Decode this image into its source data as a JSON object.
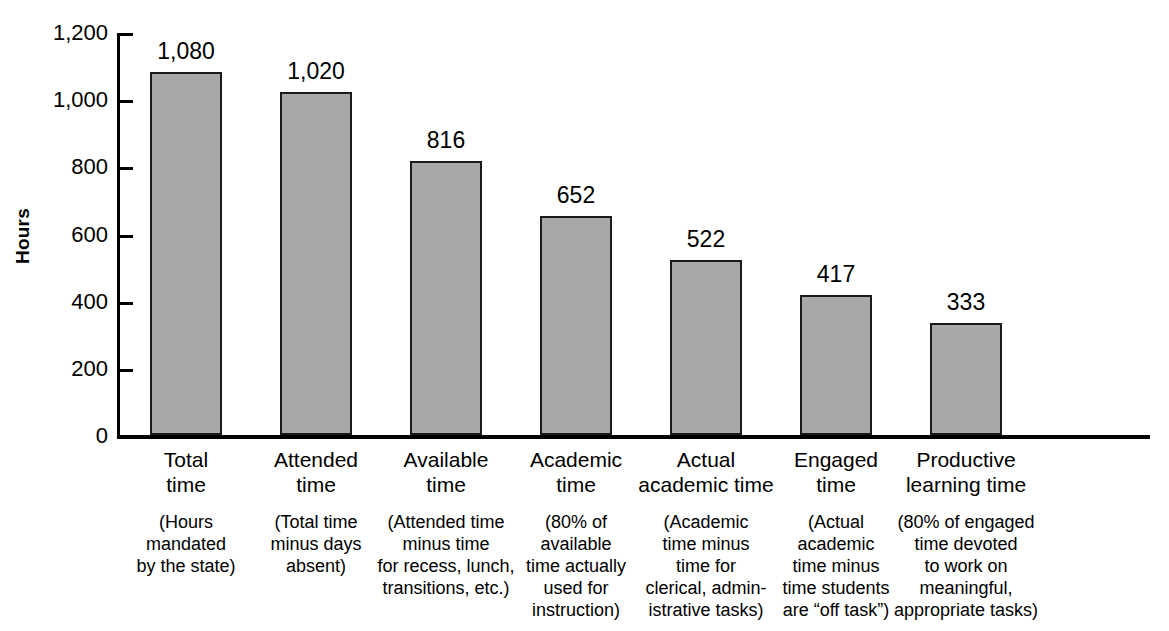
{
  "chart_data": {
    "type": "bar",
    "title": "",
    "xlabel": "",
    "ylabel": "Hours",
    "ylim": [
      0,
      1200
    ],
    "grid": false,
    "legend": null,
    "categories": [
      "Total\ntime",
      "Attended\ntime",
      "Available\ntime",
      "Academic\ntime",
      "Actual\nacademic time",
      "Engaged\ntime",
      "Productive\nlearning time"
    ],
    "category_notes": [
      "(Hours\nmandated\nby the state)",
      "(Total time\nminus days\nabsent)",
      "(Attended time\nminus time\nfor recess, lunch,\ntransitions, etc.)",
      "(80% of\navailable\ntime actually\nused for\ninstruction)",
      "(Academic\ntime minus\ntime for\nclerical, admin-\nistrative tasks)",
      "(Actual\nacademic\ntime minus\ntime students\nare “off task”)",
      "(80% of engaged\ntime devoted\nto work on\nmeaningful,\nappropriate tasks)"
    ],
    "values": [
      1080,
      1020,
      816,
      652,
      522,
      417,
      333
    ],
    "value_labels": [
      "1,080",
      "1,020",
      "816",
      "652",
      "522",
      "417",
      "333"
    ],
    "y_ticks": [
      0,
      200,
      400,
      600,
      800,
      1000,
      1200
    ],
    "y_tick_labels": [
      "0",
      "200",
      "400",
      "600",
      "800",
      "1,000",
      "1,200"
    ],
    "colors": {
      "bar_fill": "#a8a8a8",
      "bar_border": "#1a1a1a",
      "axis": "#000000",
      "text": "#000000",
      "background": "#ffffff"
    }
  }
}
